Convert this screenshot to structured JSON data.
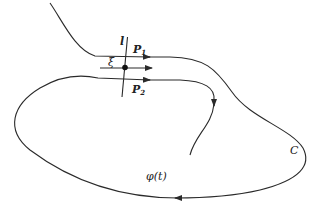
{
  "diagram": {
    "labels": {
      "line": "l",
      "p1": "P",
      "p1_sub": "1",
      "xi": "ξ",
      "p2": "P",
      "p2_sub": "2",
      "curve": "C",
      "trajectory": "φ(t)"
    },
    "colors": {
      "stroke": "#2a2a2a",
      "background": "#ffffff"
    }
  }
}
